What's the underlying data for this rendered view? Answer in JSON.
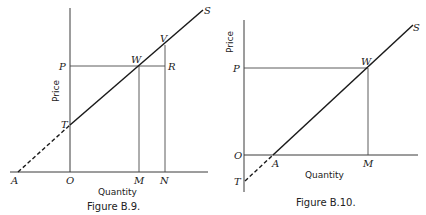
{
  "figures": [
    {
      "caption": "Figure B.9.",
      "xlabel": "Quantity",
      "ylabel": "Price",
      "points": {
        "S": "S",
        "V": "V",
        "P": "P",
        "W": "W",
        "R": "R",
        "T": "T",
        "A": "A",
        "O": "O",
        "M": "M",
        "N": "N"
      },
      "description": "Upward-sloping supply line S with positive price intercept T; dashed extension to A on negative quantity axis; price line P meets S at W above M; vertical from N meets S at V and P-line at R."
    },
    {
      "caption": "Figure B.10.",
      "xlabel": "Quantity",
      "ylabel": "Price",
      "points": {
        "S": "S",
        "P": "P",
        "W": "W",
        "O": "O",
        "A": "A",
        "M": "M",
        "T": "T"
      },
      "description": "Upward-sloping supply line S with positive quantity intercept A; dashed extension to T on negative price axis; price line P meets S at W above M."
    }
  ]
}
